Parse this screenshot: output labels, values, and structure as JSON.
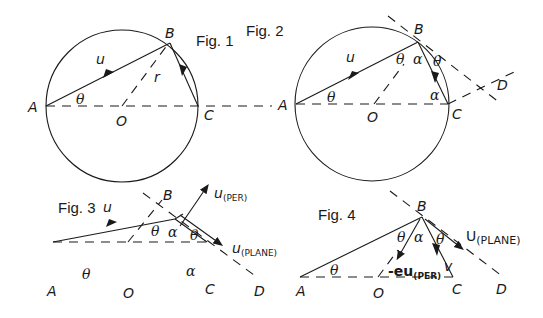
{
  "figures": [
    {
      "id": "fig1",
      "title": "Fig. 1",
      "points": {
        "A": "A",
        "B": "B",
        "C": "C",
        "O": "O"
      },
      "vector": "u",
      "radius": "r",
      "angle": "θ"
    },
    {
      "id": "fig2",
      "title": "Fig. 2",
      "points": {
        "A": "A",
        "B": "B",
        "C": "C",
        "O": "O",
        "D": "D"
      },
      "vector": "u",
      "angles": {
        "theta": "θ",
        "alpha": "α"
      }
    },
    {
      "id": "fig3",
      "title": "Fig. 3",
      "points": {
        "A": "A",
        "B": "B",
        "C": "C",
        "O": "O",
        "D": "D"
      },
      "vector": "u",
      "u_per": {
        "base": "u",
        "sub": "(PER)"
      },
      "u_plane": {
        "base": "u",
        "sub": "(PLANE)"
      },
      "angles": {
        "theta": "θ",
        "alpha": "α"
      }
    },
    {
      "id": "fig4",
      "title": "Fig. 4",
      "points": {
        "A": "A",
        "B": "B",
        "C": "C",
        "O": "O",
        "D": "D"
      },
      "u_plane": {
        "base": "U",
        "sub": "(PLANE)"
      },
      "neg_eu_per": {
        "base": "-eu",
        "sub": "(PER)"
      },
      "v": "v",
      "angles": {
        "theta": "θ",
        "alpha": "α"
      }
    }
  ]
}
